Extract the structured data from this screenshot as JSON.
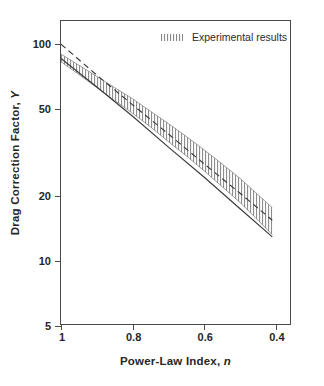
{
  "chart_data": {
    "type": "line",
    "title": "",
    "xlabel": "Power-Law Index, n",
    "xlabel_main": "Power-Law Index,",
    "xlabel_italic": "n",
    "ylabel": "Drag Correction Factor, Y",
    "ylabel_main": "Drag Correction Factor,",
    "ylabel_italic": "Y",
    "xscale": "linear",
    "yscale": "log",
    "xlim": [
      1.0,
      0.355
    ],
    "ylim": [
      5,
      128
    ],
    "x_reversed": true,
    "grid": false,
    "xticks": [
      1,
      0.8,
      0.6,
      0.4
    ],
    "xtick_labels": [
      "1",
      "0.8",
      "0.6",
      "0.4"
    ],
    "yticks": [
      100,
      50,
      20,
      10,
      5
    ],
    "ytick_labels": [
      "100",
      "50",
      "20",
      "10",
      "5"
    ],
    "legend": {
      "position": "top-right-inside",
      "entries": [
        {
          "label": "Experimental results",
          "marker": "hatched-band"
        }
      ]
    },
    "series": [
      {
        "name": "Experimental results",
        "style": "hatched-band",
        "x": [
          1.0,
          0.95,
          0.9,
          0.85,
          0.8,
          0.75,
          0.7,
          0.65,
          0.6,
          0.55,
          0.5,
          0.45,
          0.41
        ],
        "upper": [
          90,
          80,
          71,
          63,
          56,
          49,
          43,
          37.5,
          32.5,
          28,
          24,
          20.2,
          17.6
        ],
        "lower": [
          83,
          72.5,
          63,
          55,
          48,
          41.5,
          35.5,
          30.5,
          26,
          22,
          18.6,
          15.4,
          13.2
        ]
      },
      {
        "name": "Band centre line",
        "style": "dashed",
        "x": [
          1.0,
          0.9,
          0.8,
          0.7,
          0.6,
          0.5,
          0.41
        ],
        "y": [
          100,
          72,
          52.5,
          38.5,
          28,
          20.5,
          15.4
        ]
      },
      {
        "name": "Predicted / theory line",
        "style": "solid",
        "x": [
          1.0,
          0.9,
          0.8,
          0.7,
          0.6,
          0.5,
          0.41
        ],
        "y": [
          86,
          63.5,
          46.5,
          33.5,
          24.3,
          17.4,
          12.9
        ]
      }
    ],
    "colors": {
      "axis": "#4a4a4a",
      "text": "#262626",
      "band": "#6b6b6b",
      "dashed_line": "#3a3a3a",
      "solid_line": "#3a3a3a",
      "background": "#ffffff"
    }
  }
}
